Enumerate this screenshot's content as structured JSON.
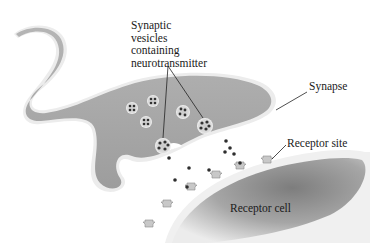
{
  "diagram": {
    "labels": {
      "vesicles": [
        "Synaptic",
        "vesicles",
        "containing",
        "neurotransmitter"
      ],
      "synapse": "Synapse",
      "receptor_site": "Receptor site",
      "receptor_cell": "Receptor cell"
    },
    "colors": {
      "axon_fill": "#a9a9a9",
      "axon_edge": "#e6e6e6",
      "receptor_cell_fill": "#9a9a9a",
      "vesicle_fill": "#d8d8d8",
      "neurotransmitter_dot": "#333333",
      "leader_line": "#222222"
    },
    "vesicle_count": 7,
    "free_neurotransmitter_count": 10,
    "receptor_site_count": 6
  }
}
